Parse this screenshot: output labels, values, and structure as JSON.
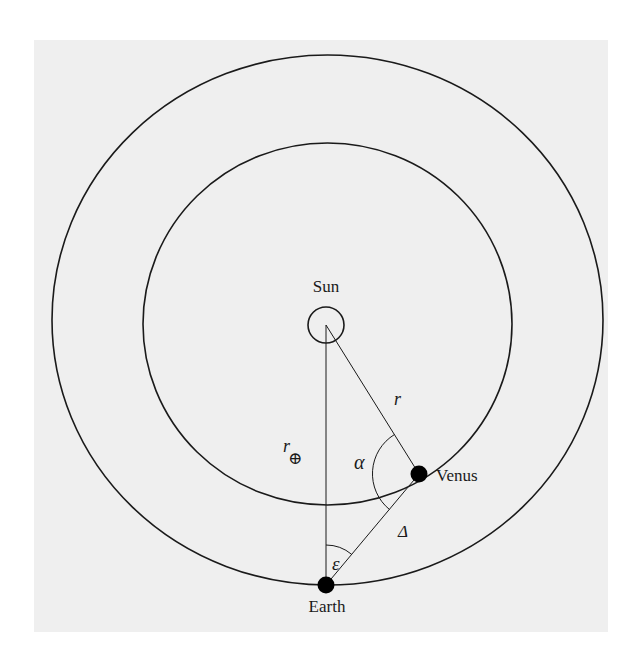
{
  "figure": {
    "background_color": "#efefef",
    "line_color": "#1a1a1a",
    "labels": {
      "sun": "Sun",
      "venus": "Venus",
      "earth": "Earth",
      "r_venus": "r",
      "r_earth": "r",
      "r_earth_subscript": "⊕",
      "alpha": "α",
      "epsilon": "ε",
      "delta": "Δ"
    },
    "elements": {
      "outer_orbit": "Earth orbit",
      "inner_orbit": "Venus orbit",
      "sun_marker": "Sun",
      "venus_marker": "Venus",
      "earth_marker": "Earth"
    }
  }
}
